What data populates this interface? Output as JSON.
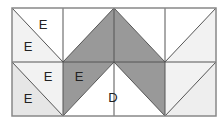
{
  "figure": {
    "type": "tiling-diagram",
    "grid": {
      "columns": 4,
      "rows": 2
    },
    "colors": {
      "white": "#ffffff",
      "light": "#f2f2f2",
      "lighter_gray": "#e6e6e6",
      "dark": "#999999",
      "stroke": "#555555",
      "border": "#888888"
    },
    "labels": [
      {
        "id": "label-top-left-upper",
        "text": "E"
      },
      {
        "id": "label-top-left-lower",
        "text": "E"
      },
      {
        "id": "label-bottom-left-upper",
        "text": "E"
      },
      {
        "id": "label-bottom-left-lower",
        "text": "E"
      },
      {
        "id": "label-bottom-dark",
        "text": "E"
      },
      {
        "id": "label-center-white",
        "text": "D"
      }
    ]
  }
}
